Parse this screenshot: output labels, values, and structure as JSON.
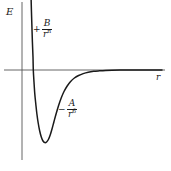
{
  "figure": {
    "kind": "potential-energy-curve",
    "background_color": "#ffffff",
    "curve_color": "#1a1a1a",
    "axis_color": "#555555"
  },
  "axes": {
    "y_label": "E",
    "x_label": "r"
  },
  "annotations": {
    "repulsive": {
      "sign": "+",
      "numerator": "B",
      "denominator_base": "r",
      "denominator_exponent": "n"
    },
    "attractive": {
      "sign": "−",
      "numerator": "A",
      "denominator_base": "r",
      "denominator_exponent": "6"
    }
  },
  "chart_data": {
    "type": "line",
    "title": "",
    "xlabel": "r",
    "ylabel": "E",
    "grid": false,
    "legend": null,
    "xlim": [
      0,
      1
    ],
    "ylim": [
      -1,
      1
    ],
    "annotations": [
      "+B/r^n",
      "-A/r^6"
    ],
    "series": [
      {
        "name": "E(r)",
        "points": [
          [
            31.0,
            -6.0
          ],
          [
            31.4,
            10.0
          ],
          [
            31.9,
            26.0
          ],
          [
            32.4,
            42.0
          ],
          [
            33.0,
            57.0
          ],
          [
            33.3,
            70.0
          ],
          [
            34.0,
            82.0
          ],
          [
            34.8,
            94.0
          ],
          [
            35.8,
            104.0
          ],
          [
            36.9,
            114.0
          ],
          [
            38.2,
            123.0
          ],
          [
            39.7,
            131.0
          ],
          [
            41.3,
            137.0
          ],
          [
            43.0,
            141.0
          ],
          [
            44.8,
            142.6
          ],
          [
            46.6,
            142.0
          ],
          [
            48.4,
            139.5
          ],
          [
            50.2,
            135.0
          ],
          [
            52.0,
            129.0
          ],
          [
            54.0,
            121.5
          ],
          [
            56.2,
            113.5
          ],
          [
            58.6,
            105.5
          ],
          [
            61.2,
            98.0
          ],
          [
            64.0,
            91.5
          ],
          [
            67.2,
            86.0
          ],
          [
            70.6,
            81.5
          ],
          [
            74.4,
            78.0
          ],
          [
            78.6,
            75.5
          ],
          [
            83.2,
            73.6
          ],
          [
            88.2,
            72.2
          ],
          [
            93.6,
            71.3
          ],
          [
            99.4,
            70.8
          ],
          [
            105.6,
            70.4
          ],
          [
            112.0,
            70.2
          ],
          [
            120.0,
            70.1
          ],
          [
            130.0,
            70.0
          ],
          [
            145.0,
            70.0
          ],
          [
            162.0,
            70.0
          ]
        ],
        "note": "points are pixel coordinates (x right, y down) in the 171x171 figure; horizontal axis baseline at y=70"
      }
    ],
    "features": {
      "zero_crossing_x": 33.3,
      "minimum": {
        "x": 44.8,
        "y": -1.0
      },
      "asymptote_y": 0
    }
  }
}
